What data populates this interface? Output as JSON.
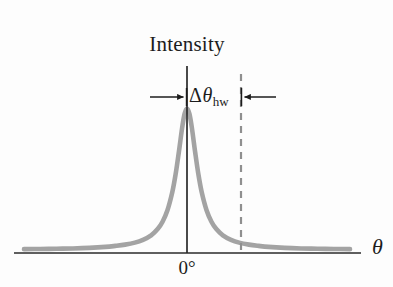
{
  "figure": {
    "kind": "diffraction-intensity-peak-diagram",
    "background_color": "#fdfdfd",
    "axis_color": "#2a2a2a",
    "curve_color": "#a3a3a3",
    "dashed_line_color": "#8f8f8f",
    "text_color": "#1c1c1c"
  },
  "labels": {
    "y_axis_title": "Intensity",
    "x_axis_symbol": "θ",
    "x_axis_origin": "0°",
    "halfwidth_delta": "Δ",
    "halfwidth_theta": "θ",
    "halfwidth_subscript": "hw"
  },
  "chart_data": {
    "type": "line",
    "title": "Intensity",
    "xlabel": "θ",
    "ylabel": "Intensity",
    "grid": false,
    "legend": null,
    "xlim": [
      -1.0,
      1.0
    ],
    "ylim": [
      0,
      1.0
    ],
    "tick_labels": {
      "x": [
        "0°"
      ],
      "y": []
    },
    "annotations": [
      {
        "name": "half-width-measure",
        "text": "Δθhw",
        "kind": "double-headed-arrow",
        "from_x": -0.22,
        "to_x": 0.33,
        "y": 0.93
      },
      {
        "name": "half-width-marker",
        "kind": "vertical-dashed-line",
        "x": 0.33
      }
    ],
    "series": [
      {
        "name": "intensity",
        "shape": "lorentzian-peak",
        "peak_x": 0.0,
        "peak_y": 1.0,
        "half_width_at_half_max": 0.075,
        "x": [
          -1.0,
          -0.9,
          -0.8,
          -0.7,
          -0.6,
          -0.5,
          -0.44,
          -0.38,
          -0.32,
          -0.27,
          -0.22,
          -0.18,
          -0.15,
          -0.12,
          -0.09,
          -0.07,
          -0.05,
          -0.03,
          -0.015,
          0.0,
          0.015,
          0.03,
          0.05,
          0.07,
          0.09,
          0.12,
          0.15,
          0.18,
          0.22,
          0.27,
          0.32,
          0.38,
          0.44,
          0.5,
          0.6,
          0.7,
          0.8,
          0.9,
          1.0
        ],
        "y": [
          0.006,
          0.007,
          0.009,
          0.011,
          0.015,
          0.022,
          0.029,
          0.038,
          0.052,
          0.072,
          0.104,
          0.148,
          0.2,
          0.281,
          0.41,
          0.534,
          0.692,
          0.862,
          0.962,
          1.0,
          0.962,
          0.862,
          0.692,
          0.534,
          0.41,
          0.281,
          0.2,
          0.148,
          0.104,
          0.072,
          0.052,
          0.038,
          0.029,
          0.022,
          0.015,
          0.011,
          0.009,
          0.007,
          0.006
        ]
      }
    ]
  }
}
